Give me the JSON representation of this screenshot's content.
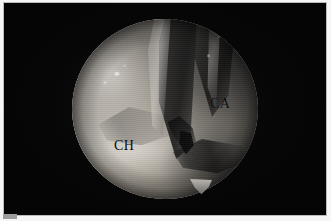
{
  "figure": {
    "kind": "arthroscopic-photograph",
    "modality": "shoulder arthroscopy",
    "frame": {
      "background_color": "#050505",
      "border_color": "#bdbdbd",
      "paper_color": "#f6f6f6"
    },
    "scope_view": {
      "shape": "circle",
      "notch_position": "bottom-right",
      "center_x": 161,
      "center_y": 106,
      "radius": 93,
      "tissue_tone": "#8e8b87"
    },
    "labels": [
      {
        "id": "ca",
        "text": "CA",
        "color": "#0a0a0a",
        "x": 206,
        "y": 94
      },
      {
        "id": "ch",
        "text": "CH",
        "color": "#0a0a0a",
        "x": 110,
        "y": 136
      }
    ],
    "structures": [
      {
        "name": "ligament-band-central",
        "description": "dark band descending from top centre"
      },
      {
        "name": "probe-shaft",
        "description": "bright slender instrument shaft"
      },
      {
        "name": "ligament-band-right",
        "description": "dark band descending at upper right"
      },
      {
        "name": "instrument-tip",
        "description": "dark hooked tip near centre"
      },
      {
        "name": "tissue-fold",
        "description": "dark crease running to lower right"
      },
      {
        "name": "sulcus",
        "description": "soft shadowed groove left of centre"
      }
    ]
  }
}
